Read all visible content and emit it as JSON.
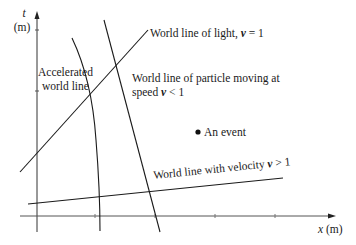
{
  "diagram": {
    "type": "spacetime-diagram",
    "axes": {
      "t_label_var": "t",
      "t_label_unit": "(m)",
      "x_label_var": "x",
      "x_label_unit": "(m)"
    },
    "labels": {
      "light": {
        "text": "World line of light, ",
        "var": "v",
        "rel": " = 1"
      },
      "accelerated_line1": "Accelerated",
      "accelerated_line2": "world line",
      "particle_line1": "World line of particle moving at",
      "particle_line2_text": "speed  ",
      "particle_line2_var": "v",
      "particle_line2_rel": " < 1",
      "event": "An event",
      "superluminal": {
        "text": "World line with velocity ",
        "var": "v",
        "rel": " > 1"
      }
    },
    "colors": {
      "ink": "#1a1a1a",
      "axis": "#333333",
      "background": "#ffffff"
    }
  }
}
